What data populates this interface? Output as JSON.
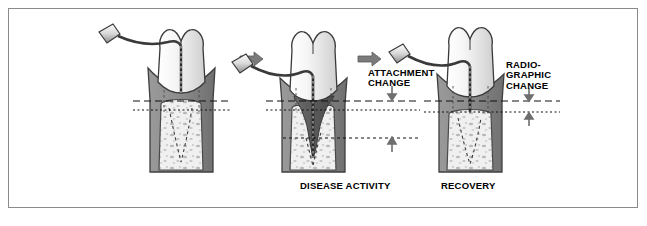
{
  "figure": {
    "kind": "medical-illustration",
    "frame": {
      "border_color": "#8a8a8a",
      "background": "#ffffff"
    },
    "panels": [
      {
        "id": "panel-baseline",
        "caption": "",
        "probe_label": "periodontal probe",
        "state": "baseline / healthy probing depth"
      },
      {
        "id": "panel-disease",
        "caption": "DISEASE ACTIVITY",
        "probe_label": "periodontal probe",
        "state": "deep probing, bone crater, apical attachment"
      },
      {
        "id": "panel-recovery",
        "caption": "RECOVERY",
        "probe_label": "periodontal probe",
        "state": "reduced probing depth, bone fill"
      }
    ],
    "annotations": [
      {
        "id": "attachment-change",
        "lines": [
          "ATTACHMENT",
          "CHANGE"
        ],
        "arrow": "down"
      },
      {
        "id": "radiographic-change",
        "lines": [
          "RADIO-",
          "GRAPHIC",
          "CHANGE"
        ],
        "arrow": "down-up"
      }
    ],
    "captions": {
      "disease": "DISEASE ACTIVITY",
      "recovery": "RECOVERY",
      "attachment_line1": "ATTACHMENT",
      "attachment_line2": "CHANGE",
      "radiographic_line1": "RADIO-",
      "radiographic_line2": "GRAPHIC",
      "radiographic_line3": "CHANGE"
    },
    "colors": {
      "enamel": "#f2f2f2",
      "enamel_shadow": "#d9d9d9",
      "gingiva": "#8c8c8c",
      "gingiva_dark": "#7a7a7a",
      "bone": "#efefef",
      "bone_speck": "#b5b5b5",
      "root_dark": "#5a5a5a",
      "outline": "#3a3a3a",
      "arrow": "#6e6e6e",
      "reference_line": "#1a1a1a"
    }
  }
}
